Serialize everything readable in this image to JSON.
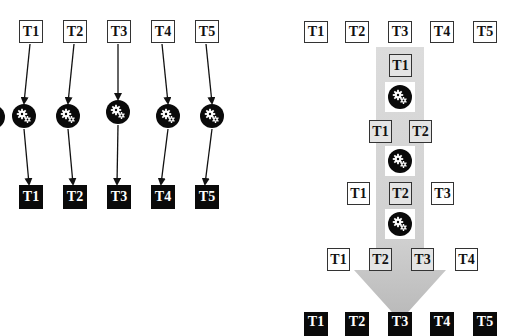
{
  "left_diagram": {
    "title": "per-task processing",
    "inputs": [
      "T1",
      "T2",
      "T3",
      "T4",
      "T5"
    ],
    "outputs": [
      "T1",
      "T2",
      "T3",
      "T4",
      "T5"
    ],
    "processor_icon": "gears-icon"
  },
  "right_diagram": {
    "title": "cumulative processing",
    "inputs": [
      "T1",
      "T2",
      "T3",
      "T4",
      "T5"
    ],
    "stages": [
      {
        "tasks": [
          "T1"
        ]
      },
      {
        "tasks": [
          "T1",
          "T2"
        ]
      },
      {
        "tasks": [
          "T1",
          "T2",
          "T3"
        ]
      },
      {
        "tasks": [
          "T1",
          "T2",
          "T3",
          "T4"
        ]
      }
    ],
    "outputs": [
      "T1",
      "T2",
      "T3",
      "T4",
      "T5"
    ],
    "processor_icon": "gears-icon",
    "flow_arrow": "down-arrow"
  },
  "colors": {
    "dark": "#0a0a0a",
    "band": "#d9d9d9",
    "shaded_box": "#e4e4e4"
  }
}
